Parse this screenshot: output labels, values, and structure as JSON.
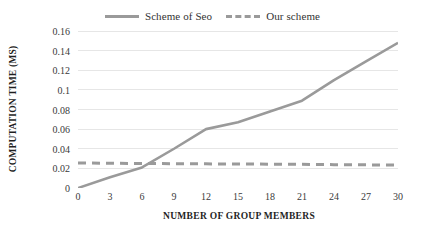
{
  "legend": {
    "position": "top-center",
    "entries": [
      {
        "label": "Scheme of Seo",
        "style": "solid",
        "color": "#9a9a9a",
        "icon": "solid-line-swatch-icon"
      },
      {
        "label": "Our scheme",
        "style": "dashed",
        "color": "#9a9a9a",
        "icon": "dashed-line-swatch-icon"
      }
    ]
  },
  "axis": {
    "x_title": "NUMBER OF GROUP MEMBERS",
    "y_title": "COMPUTATION TIME (MS)",
    "x_ticks": [
      "0",
      "3",
      "6",
      "9",
      "12",
      "15",
      "18",
      "21",
      "24",
      "27",
      "30"
    ],
    "y_ticks": [
      "0.16",
      "0.14",
      "0.12",
      "0.1",
      "0.08",
      "0.06",
      "0.04",
      "0.02",
      "0"
    ]
  },
  "colors": {
    "line": "#9a9a9a",
    "gridline": "#e6e6e6",
    "text": "#2b2b2b",
    "background": "#ffffff"
  },
  "chart_data": {
    "type": "line",
    "title": "",
    "xlabel": "NUMBER OF GROUP MEMBERS",
    "ylabel": "COMPUTATION TIME (MS)",
    "x": [
      0,
      3,
      6,
      9,
      12,
      15,
      18,
      21,
      24,
      27,
      30
    ],
    "xlim": [
      0,
      30
    ],
    "ylim": [
      0,
      0.16
    ],
    "ytick_values": [
      0,
      0.02,
      0.04,
      0.06,
      0.08,
      0.1,
      0.12,
      0.14,
      0.16
    ],
    "xtick_values": [
      0,
      3,
      6,
      9,
      12,
      15,
      18,
      21,
      24,
      27,
      30
    ],
    "grid": "horizontal",
    "legend_position": "top-center",
    "series": [
      {
        "name": "Scheme of Seo",
        "style": "solid",
        "color": "#9a9a9a",
        "values": [
          0,
          0.011,
          0.021,
          0.04,
          0.06,
          0.067,
          0.078,
          0.089,
          0.11,
          0.129,
          0.148
        ]
      },
      {
        "name": "Our scheme",
        "style": "dashed",
        "color": "#9a9a9a",
        "values": [
          0.0255,
          0.0252,
          0.025,
          0.0248,
          0.0246,
          0.0245,
          0.0243,
          0.0241,
          0.0238,
          0.0236,
          0.0233
        ]
      }
    ]
  }
}
